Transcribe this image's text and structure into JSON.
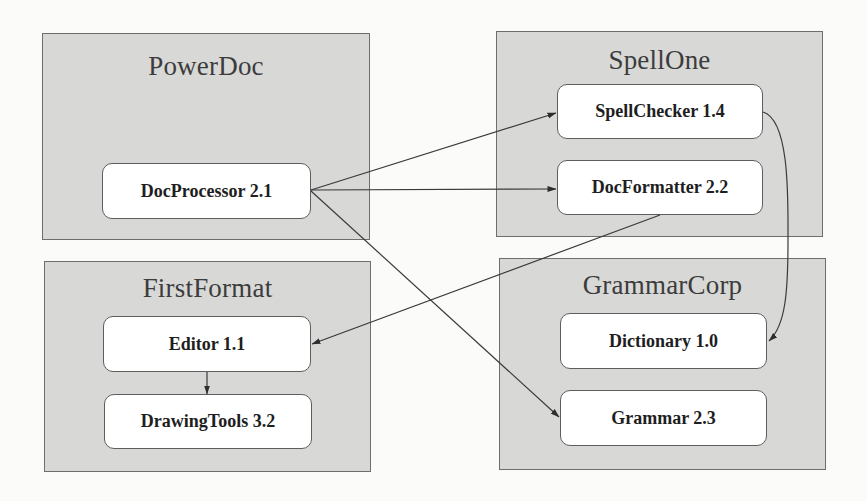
{
  "diagram": {
    "type": "component-dependency-diagram",
    "colors": {
      "background": "#fbfbfa",
      "group_fill": "#d8d8d7",
      "group_border": "#6e6e6e",
      "node_fill": "#ffffff",
      "node_border": "#5e5e5e",
      "edge": "#3a3a3a",
      "title_text": "#3c3c3c",
      "node_text": "#1e1e1e"
    },
    "groups": [
      {
        "id": "powerdoc",
        "title": "PowerDoc",
        "nodes": [
          {
            "id": "docprocessor",
            "label": "DocProcessor 2.1"
          }
        ]
      },
      {
        "id": "spellone",
        "title": "SpellOne",
        "nodes": [
          {
            "id": "spellchecker",
            "label": "SpellChecker 1.4"
          },
          {
            "id": "docformatter",
            "label": "DocFormatter 2.2"
          }
        ]
      },
      {
        "id": "firstformat",
        "title": "FirstFormat",
        "nodes": [
          {
            "id": "editor",
            "label": "Editor 1.1"
          },
          {
            "id": "drawingtools",
            "label": "DrawingTools 3.2"
          }
        ]
      },
      {
        "id": "grammarcorp",
        "title": "GrammarCorp",
        "nodes": [
          {
            "id": "dictionary",
            "label": "Dictionary 1.0"
          },
          {
            "id": "grammar",
            "label": "Grammar 2.3"
          }
        ]
      }
    ],
    "edges": [
      {
        "from": "DocProcessor 2.1",
        "to": "SpellChecker 1.4"
      },
      {
        "from": "DocProcessor 2.1",
        "to": "DocFormatter 2.2"
      },
      {
        "from": "DocProcessor 2.1",
        "to": "Grammar 2.3"
      },
      {
        "from": "DocFormatter 2.2",
        "to": "Editor 1.1"
      },
      {
        "from": "SpellChecker 1.4",
        "to": "Dictionary 1.0"
      },
      {
        "from": "Editor 1.1",
        "to": "DrawingTools 3.2"
      }
    ]
  }
}
